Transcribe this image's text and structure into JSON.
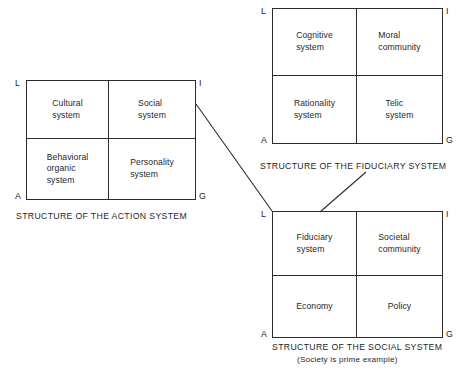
{
  "figure": {
    "line_color": "#2b2b2b",
    "text_color": "#1f1f1f",
    "background": "#ffffff"
  },
  "diagrams": [
    {
      "id": "action-system",
      "caption": "STRUCTURE OF THE ACTION SYSTEM",
      "subcaption": "",
      "corners": {
        "top_left": "L",
        "top_right": "I",
        "bottom_left": "A",
        "bottom_right": "G"
      },
      "cells": {
        "top_left": "Cultural\nsystem",
        "top_right": "Social\nsystem",
        "bottom_left": "Behavioral\norganic\nsystem",
        "bottom_right": "Personality\nsystem"
      }
    },
    {
      "id": "fiduciary-system",
      "caption": "STRUCTURE OF THE FIDUCIARY SYSTEM",
      "subcaption": "",
      "corners": {
        "top_left": "L",
        "top_right": "I",
        "bottom_left": "A",
        "bottom_right": "G"
      },
      "cells": {
        "top_left": "Cognitive\nsystem",
        "top_right": "Moral\ncommunity",
        "bottom_left": "Rationality\nsystem",
        "bottom_right": "Telic\nsystem"
      }
    },
    {
      "id": "social-system",
      "caption": "STRUCTURE OF THE SOCIAL SYSTEM",
      "subcaption": "(Society is prime example)",
      "corners": {
        "top_left": "L",
        "top_right": "I",
        "bottom_left": "A",
        "bottom_right": "G"
      },
      "cells": {
        "top_left": "Fiduciary\nsystem",
        "top_right": "Societal\ncommunity",
        "bottom_left": "Economy",
        "bottom_right": "Policy"
      }
    }
  ],
  "connectors": [
    {
      "id": "social-system-expansion",
      "from": "action-system.top_right.social_system",
      "to": "social-system.box_top_left"
    },
    {
      "id": "fiduciary-system-expansion",
      "from": "social-system.top_left.fiduciary_system",
      "to": "fiduciary-system.caption"
    }
  ]
}
